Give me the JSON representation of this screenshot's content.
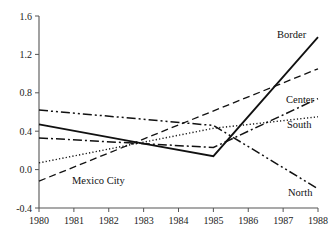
{
  "chart_data": {
    "type": "line",
    "title": "",
    "subtitle": "",
    "xlabel": "",
    "ylabel": "",
    "x": [
      1980,
      1981,
      1982,
      1983,
      1984,
      1985,
      1986,
      1987,
      1988
    ],
    "xtick_labels": [
      "1980",
      "1981",
      "1982",
      "1983",
      "1984",
      "1985",
      "1986",
      "1987",
      "1988"
    ],
    "ytick_labels": [
      "1.6",
      "1.2",
      "0.8",
      "0.4",
      "0.0",
      "-0.4"
    ],
    "ytick_values": [
      1.6,
      1.2,
      0.8,
      0.4,
      0.0,
      -0.4
    ],
    "xlim": [
      1980,
      1988
    ],
    "ylim": [
      -0.4,
      1.6
    ],
    "grid": false,
    "legend_position": "inline-right-labels",
    "series": [
      {
        "name": "Border",
        "label": "Border",
        "style": "solid",
        "x": [
          1980,
          1983,
          1985,
          1988
        ],
        "values": [
          0.47,
          0.27,
          0.14,
          1.38
        ]
      },
      {
        "name": "Mexico City",
        "label": "Mexico City",
        "style": "dashed",
        "x": [
          1980,
          1988
        ],
        "values": [
          -0.12,
          1.05
        ]
      },
      {
        "name": "Center",
        "label": "Center",
        "style": "dash-dot",
        "x": [
          1980,
          1985,
          1988
        ],
        "values": [
          0.33,
          0.23,
          0.74
        ]
      },
      {
        "name": "South",
        "label": "South",
        "style": "dotted",
        "x": [
          1980,
          1985,
          1988
        ],
        "values": [
          0.07,
          0.43,
          0.55
        ]
      },
      {
        "name": "North",
        "label": "North",
        "style": "dash-dot-dot",
        "x": [
          1980,
          1985,
          1988
        ],
        "values": [
          0.62,
          0.46,
          -0.2
        ]
      }
    ],
    "annotations": [
      {
        "name": "border-label",
        "text": "Border",
        "x": 277,
        "y": 38
      },
      {
        "name": "center-label",
        "text": "Center",
        "x": 286,
        "y": 103
      },
      {
        "name": "south-label",
        "text": "South",
        "x": 287,
        "y": 128
      },
      {
        "name": "north-label",
        "text": "North",
        "x": 288,
        "y": 196
      },
      {
        "name": "mexico-city-label",
        "text": "Mexico City",
        "x": 72,
        "y": 184
      }
    ],
    "colors": {
      "line": "#111111",
      "axis": "#555555",
      "background": "#ffffff",
      "text": "#1a1a1a"
    },
    "geometry": {
      "plot_left": 39,
      "plot_right": 318,
      "plot_top": 16,
      "plot_bottom": 208
    }
  }
}
